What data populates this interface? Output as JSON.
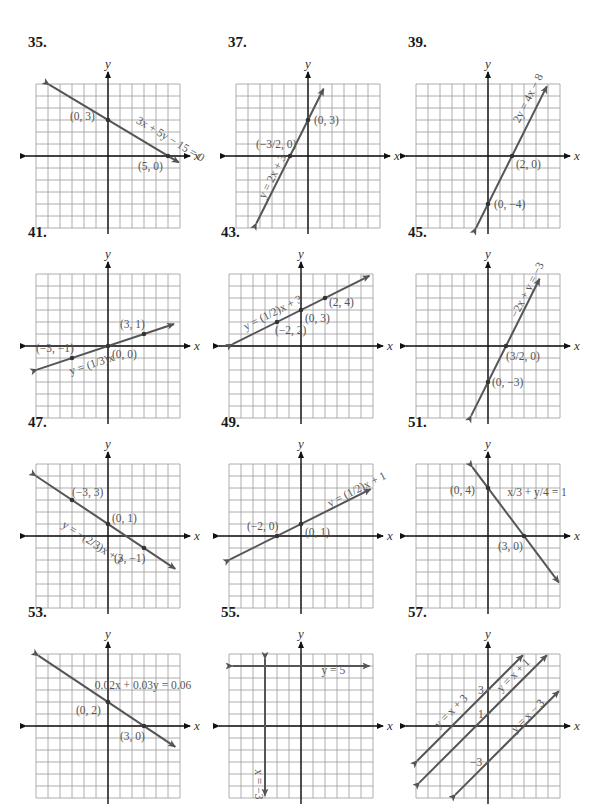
{
  "chart_data": [
    {
      "id": "35",
      "type": "line",
      "title": "35.",
      "xlabel": "x",
      "ylabel": "y",
      "xlim": [
        -6,
        6
      ],
      "ylim": [
        -6,
        6
      ],
      "grid": true,
      "series": [
        {
          "name": "3x + 5y − 15 = 0",
          "slope": -0.6,
          "intercept": 3,
          "x_range": [
            -4.9,
            5.9
          ],
          "label_pos": [
            2.3,
            2.8
          ],
          "label_angle": 31
        }
      ],
      "points": [
        {
          "x": 0,
          "y": 3,
          "label": "(0, 3)",
          "dx": -38,
          "dy": 0
        },
        {
          "x": 5,
          "y": 0,
          "label": "(5, 0)",
          "dx": -30,
          "dy": 14
        }
      ]
    },
    {
      "id": "37",
      "type": "line",
      "title": "37.",
      "xlabel": "x",
      "ylabel": "y",
      "xlim": [
        -6,
        6
      ],
      "ylim": [
        -6,
        6
      ],
      "grid": true,
      "series": [
        {
          "name": "y = 2x + 3",
          "slope": 2,
          "intercept": 3,
          "x_range": [
            -4.3,
            1.3
          ],
          "label_pos": [
            -3.6,
            -3.6
          ],
          "label_angle": -63
        }
      ],
      "points": [
        {
          "x": 0,
          "y": 3,
          "label": "(0, 3)",
          "dx": 6,
          "dy": 4
        },
        {
          "x": -1.5,
          "y": 0,
          "label": "(−3/2, 0)",
          "dx": -34,
          "dy": -8
        }
      ]
    },
    {
      "id": "39",
      "type": "line",
      "title": "39.",
      "xlabel": "x",
      "ylabel": "y",
      "xlim": [
        -6,
        6
      ],
      "ylim": [
        -6,
        6
      ],
      "grid": true,
      "series": [
        {
          "name": "2y = 4x − 8",
          "slope": 2,
          "intercept": -4,
          "x_range": [
            -1,
            4.9
          ],
          "label_pos": [
            2.6,
            2.7
          ],
          "label_angle": -63
        }
      ],
      "points": [
        {
          "x": 2,
          "y": 0,
          "label": "(2, 0)",
          "dx": 4,
          "dy": 12
        },
        {
          "x": 0,
          "y": -4,
          "label": "(0, −4)",
          "dx": 6,
          "dy": 4
        }
      ]
    },
    {
      "id": "41",
      "type": "line",
      "title": "41.",
      "xlabel": "x",
      "ylabel": "y",
      "xlim": [
        -6,
        6
      ],
      "ylim": [
        -6,
        6
      ],
      "grid": true,
      "series": [
        {
          "name": "y = (1/3)x",
          "slope": 0.3333,
          "intercept": 0,
          "x_range": [
            -5.9,
            5.5
          ],
          "label_pos": [
            -3.1,
            -2.4
          ],
          "label_angle": -18
        }
      ],
      "points": [
        {
          "x": 3,
          "y": 1,
          "label": "(3, 1)",
          "dx": -24,
          "dy": -6
        },
        {
          "x": -3,
          "y": -1,
          "label": "(−3, −1)",
          "dx": -36,
          "dy": -6
        },
        {
          "x": 0,
          "y": 0,
          "label": "(0, 0)",
          "dx": 4,
          "dy": 12
        }
      ]
    },
    {
      "id": "43",
      "type": "line",
      "title": "43.",
      "xlabel": "x",
      "ylabel": "y",
      "xlim": [
        -6,
        6
      ],
      "ylim": [
        -6,
        6
      ],
      "grid": true,
      "series": [
        {
          "name": "y = (1/2)x + 3",
          "slope": 0.5,
          "intercept": 3,
          "x_range": [
            -5.7,
            5.7
          ],
          "label_pos": [
            -4.6,
            1.3
          ],
          "label_angle": -27
        }
      ],
      "points": [
        {
          "x": 2,
          "y": 4,
          "label": "(2, 4)",
          "dx": 4,
          "dy": 8
        },
        {
          "x": 0,
          "y": 3,
          "label": "(0, 3)",
          "dx": 4,
          "dy": 12
        },
        {
          "x": -2,
          "y": 2,
          "label": "(−2, 2)",
          "dx": -2,
          "dy": 12
        }
      ]
    },
    {
      "id": "45",
      "type": "line",
      "title": "45.",
      "xlabel": "x",
      "ylabel": "y",
      "xlim": [
        -6,
        6
      ],
      "ylim": [
        -6,
        6
      ],
      "grid": true,
      "series": [
        {
          "name": "−2x + y = −3",
          "slope": 2,
          "intercept": -3,
          "x_range": [
            -1.4,
            4.3
          ],
          "label_pos": [
            2.4,
            2.3
          ],
          "label_angle": -63
        }
      ],
      "points": [
        {
          "x": 1.5,
          "y": 0,
          "label": "(3/2, 0)",
          "dx": 0,
          "dy": 14
        },
        {
          "x": 0,
          "y": -3,
          "label": "(0, −3)",
          "dx": 4,
          "dy": 4
        }
      ]
    },
    {
      "id": "47",
      "type": "line",
      "title": "47.",
      "xlabel": "x",
      "ylabel": "y",
      "xlim": [
        -6,
        6
      ],
      "ylim": [
        -6,
        6
      ],
      "grid": true,
      "series": [
        {
          "name": "y = −(2/3)x + 1",
          "slope": -0.6667,
          "intercept": 1,
          "x_range": [
            -6,
            5.6
          ],
          "label_pos": [
            -3.9,
            0.8
          ],
          "label_angle": 33
        }
      ],
      "points": [
        {
          "x": -3,
          "y": 3,
          "label": "(−3, 3)",
          "dx": 0,
          "dy": -4
        },
        {
          "x": 0,
          "y": 1,
          "label": "(0, 1)",
          "dx": 4,
          "dy": -2
        },
        {
          "x": 3,
          "y": -1,
          "label": "(3, −1)",
          "dx": -30,
          "dy": 14
        }
      ]
    },
    {
      "id": "49",
      "type": "line",
      "title": "49.",
      "xlabel": "x",
      "ylabel": "y",
      "xlim": [
        -6,
        6
      ],
      "ylim": [
        -6,
        6
      ],
      "grid": true,
      "series": [
        {
          "name": "y = (1/2)x + 1",
          "slope": 0.5,
          "intercept": 1,
          "x_range": [
            -5.9,
            5.8
          ],
          "label_pos": [
            2.4,
            2.4
          ],
          "label_angle": -27
        }
      ],
      "points": [
        {
          "x": -2,
          "y": 0,
          "label": "(−2, 0)",
          "dx": -30,
          "dy": -6
        },
        {
          "x": 0,
          "y": 1,
          "label": "(0, 1)",
          "dx": 4,
          "dy": 12
        }
      ]
    },
    {
      "id": "51",
      "type": "line",
      "title": "51.",
      "xlabel": "x",
      "ylabel": "y",
      "xlim": [
        -6,
        6
      ],
      "ylim": [
        -6,
        6
      ],
      "grid": true,
      "series": [
        {
          "name": "x/3 + y/4 = 1",
          "slope": -1.3333,
          "intercept": 4,
          "x_range": [
            -1.3,
            5.9
          ],
          "label_pos": [
            1.6,
            3.3
          ],
          "label_angle": 0
        }
      ],
      "points": [
        {
          "x": 0,
          "y": 4,
          "label": "(0, 4)",
          "dx": -38,
          "dy": 6
        },
        {
          "x": 3,
          "y": 0,
          "label": "(3, 0)",
          "dx": -26,
          "dy": 14
        }
      ]
    },
    {
      "id": "53",
      "type": "line",
      "title": "53.",
      "xlabel": "x",
      "ylabel": "y",
      "xlim": [
        -6,
        6
      ],
      "ylim": [
        -6,
        6
      ],
      "grid": true,
      "series": [
        {
          "name": "0.02x + 0.03y = 0.06",
          "slope": -0.6667,
          "intercept": 2,
          "x_range": [
            -5.8,
            5.6
          ],
          "label_pos": [
            -1.1,
            3.1
          ],
          "label_angle": 0
        }
      ],
      "points": [
        {
          "x": 0,
          "y": 2,
          "label": "(0, 2)",
          "dx": -32,
          "dy": 12
        },
        {
          "x": 3,
          "y": 0,
          "label": "(3, 0)",
          "dx": -24,
          "dy": 14
        }
      ]
    },
    {
      "id": "55",
      "type": "line",
      "title": "55.",
      "xlabel": "x",
      "ylabel": "y",
      "xlim": [
        -6,
        6
      ],
      "ylim": [
        -6,
        6
      ],
      "grid": true,
      "series": [
        {
          "name": "y = 5",
          "horizontal": 5,
          "label_pos": [
            1.7,
            4.3
          ],
          "label_angle": 0
        },
        {
          "name": "x = −3",
          "vertical": -3,
          "label_pos": [
            -3.8,
            -3.6
          ],
          "label_angle": 90
        }
      ],
      "points": []
    },
    {
      "id": "57",
      "type": "line",
      "title": "57.",
      "xlabel": "x",
      "ylabel": "y",
      "xlim": [
        -6,
        6
      ],
      "ylim": [
        -6,
        6
      ],
      "grid": true,
      "series": [
        {
          "name": "y = x + 3",
          "slope": 1,
          "intercept": 3,
          "x_range": [
            -5.9,
            2.9
          ],
          "label_pos": [
            -4.1,
            -0.2
          ],
          "label_angle": -45
        },
        {
          "name": "y = x + 1",
          "slope": 1,
          "intercept": 1,
          "x_range": [
            -5.7,
            4.9
          ],
          "label_pos": [
            1.1,
            2.8
          ],
          "label_angle": -45
        },
        {
          "name": "y = x − 3",
          "slope": 1,
          "intercept": -3,
          "x_range": [
            -2.7,
            5.9
          ],
          "label_pos": [
            2.3,
            -0.6
          ],
          "label_angle": -45
        }
      ],
      "points": [],
      "annotations": [
        {
          "x": 0,
          "y": 3,
          "text": "3",
          "dx": -10,
          "dy": 4
        },
        {
          "x": 0,
          "y": 1,
          "text": "1",
          "dx": -10,
          "dy": 4
        },
        {
          "x": 0,
          "y": -3,
          "text": "−3",
          "dx": -18,
          "dy": 4
        }
      ]
    }
  ],
  "layout": {
    "panels": [
      {
        "left": 36,
        "top": 62
      },
      {
        "left": 236,
        "top": 62
      },
      {
        "left": 416,
        "top": 62
      },
      {
        "left": 36,
        "top": 252
      },
      {
        "left": 229,
        "top": 252
      },
      {
        "left": 416,
        "top": 252
      },
      {
        "left": 36,
        "top": 442
      },
      {
        "left": 229,
        "top": 442
      },
      {
        "left": 416,
        "top": 442
      },
      {
        "left": 36,
        "top": 632
      },
      {
        "left": 229,
        "top": 632
      },
      {
        "left": 416,
        "top": 632
      }
    ],
    "titles_offset": [
      -10,
      -28
    ]
  }
}
